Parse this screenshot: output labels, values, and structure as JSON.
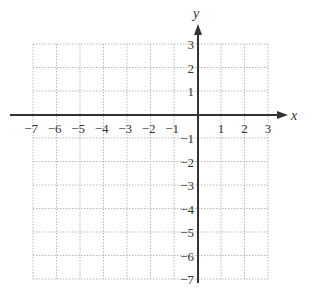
{
  "chart_data": {
    "type": "scatter",
    "title": "",
    "xlabel": "x",
    "ylabel": "y",
    "xlim": [
      -7,
      3
    ],
    "ylim": [
      -7,
      3
    ],
    "grid": true,
    "grid_style": "dotted",
    "x_ticks": [
      -7,
      -6,
      -5,
      -4,
      -3,
      -2,
      -1,
      1,
      2,
      3
    ],
    "y_ticks": [
      3,
      2,
      1,
      -1,
      -2,
      -3,
      -4,
      -5,
      -6,
      -7
    ],
    "x_tick_labels": [
      "−7",
      "−6",
      "−5",
      "−4",
      "−3",
      "−2",
      "−1",
      "1",
      "2",
      "3"
    ],
    "y_tick_labels": [
      "3",
      "2",
      "1",
      "−1",
      "−2",
      "−3",
      "−4",
      "−5",
      "−6",
      "−7"
    ],
    "series": [],
    "colors": {
      "axis": "#333333",
      "grid": "#b8b8b8",
      "background": "#ffffff"
    }
  },
  "labels": {
    "x_axis": "x",
    "y_axis": "y"
  }
}
